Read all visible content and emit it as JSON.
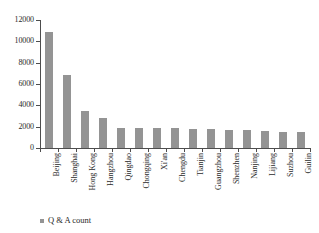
{
  "chart_data": {
    "type": "bar",
    "title": "",
    "xlabel": "",
    "ylabel": "",
    "ylim": [
      0,
      12000
    ],
    "ytick_values": [
      0,
      2000,
      4000,
      6000,
      8000,
      10000,
      12000
    ],
    "ytick_labels": [
      "0",
      "2000",
      "4000",
      "6000",
      "8000",
      "10000",
      "12000"
    ],
    "grid": false,
    "legend_position": "bottom-left",
    "series": [
      {
        "name": "Q & A count",
        "color": "#949494",
        "values": [
          10900,
          6850,
          3500,
          2800,
          1900,
          1890,
          1870,
          1850,
          1820,
          1740,
          1720,
          1660,
          1640,
          1520,
          1500
        ]
      }
    ],
    "categories": [
      "Beijing",
      "Shanghai",
      "Hong Kong",
      "Hangzhou",
      "Qingdao",
      "Chongqing",
      "Xi'an",
      "Chengdu",
      "Tianjin",
      "Guangzhou",
      "Shenzhen",
      "Nanjing",
      "Lijiang",
      "Suzhou",
      "Guilin"
    ]
  },
  "legend": {
    "label": "Q & A count",
    "swatch_color": "#949494"
  },
  "axis": {
    "line_color": "#4d4d4d",
    "tick_color": "#4d4d4d"
  }
}
